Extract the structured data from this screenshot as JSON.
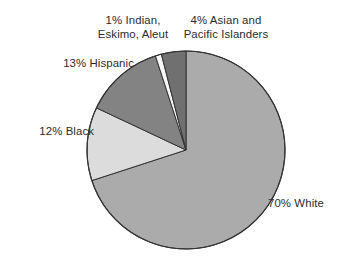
{
  "chart_data": {
    "type": "pie",
    "title": "",
    "subtitle": "",
    "xlabel": "",
    "ylabel": "",
    "legend_position": "none",
    "grid": false,
    "units": "percent",
    "categories": [
      "White",
      "Black",
      "Hispanic",
      "Indian, Eskimo, Aleut",
      "Asian and Pacific Islanders"
    ],
    "values": [
      70,
      12,
      13,
      1,
      4
    ],
    "slices": [
      {
        "id": "white",
        "label": "70% White",
        "category": "White",
        "value": 70,
        "color": "#ababab",
        "start_angle": 0,
        "end_angle": 252
      },
      {
        "id": "black",
        "label": "12% Black",
        "category": "Black",
        "value": 12,
        "color": "#dcdcdc",
        "start_angle": 252,
        "end_angle": 295.2
      },
      {
        "id": "hispanic",
        "label": "13% Hispanic",
        "category": "Hispanic",
        "value": 13,
        "color": "#838383",
        "start_angle": 295.2,
        "end_angle": 342
      },
      {
        "id": "indian",
        "label": "1% Indian, Eskimo, Aleut",
        "category": "Indian, Eskimo, Aleut",
        "value": 1,
        "color": "#f7f7f7",
        "start_angle": 342,
        "end_angle": 345.6
      },
      {
        "id": "asian",
        "label": "4% Asian and Pacific Islanders",
        "category": "Asian and Pacific Islanders",
        "value": 4,
        "color": "#707070",
        "start_angle": 345.6,
        "end_angle": 360
      }
    ],
    "outline_color": "#333333",
    "background_color": "#ffffff",
    "text_color": "#2b2b2b"
  },
  "labels": {
    "indian": {
      "line1": "1% Indian,",
      "line2": "Eskimo, Aleut"
    },
    "asian": {
      "line1": "4% Asian and",
      "line2": "Pacific Islanders"
    },
    "hispanic": {
      "line1": "13% Hispanic"
    },
    "black": {
      "line1": "12% Black"
    },
    "white": {
      "line1": "70% White"
    }
  }
}
